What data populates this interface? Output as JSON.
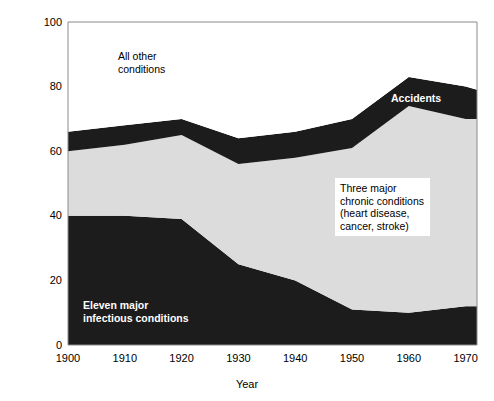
{
  "chart_data": {
    "type": "area",
    "stacked": true,
    "title": "",
    "xlabel": "Year",
    "ylabel": "Percentage of total mortality",
    "xlim": [
      1900,
      1972
    ],
    "ylim": [
      0,
      100
    ],
    "xticks": [
      1900,
      1910,
      1920,
      1930,
      1940,
      1950,
      1960,
      1970
    ],
    "xtick_labels": [
      "1900",
      "1910",
      "1920",
      "1930",
      "1940",
      "1950",
      "1960",
      "1970"
    ],
    "yticks": [
      0,
      20,
      40,
      60,
      80,
      100
    ],
    "ytick_labels": [
      "0",
      "20",
      "40",
      "60",
      "80",
      "100"
    ],
    "grid": false,
    "legend_position": "inline-annotations",
    "x": [
      1900,
      1910,
      1920,
      1930,
      1940,
      1950,
      1960,
      1970,
      1972
    ],
    "series": [
      {
        "name": "Eleven major infectious conditions",
        "color": "#1c1c1c",
        "values": [
          40,
          40,
          39,
          25,
          20,
          11,
          10,
          12,
          12
        ]
      },
      {
        "name": "Three major chronic conditions (heart disease, cancer, stroke)",
        "color": "#dcdcdc",
        "values": [
          20,
          22,
          26,
          31,
          38,
          50,
          64,
          58,
          58
        ]
      },
      {
        "name": "Accidents",
        "color": "#1c1c1c",
        "values": [
          6,
          6,
          5,
          8,
          8,
          9,
          9,
          10,
          9
        ]
      },
      {
        "name": "All other conditions",
        "color": "#ffffff",
        "values": [
          34,
          32,
          30,
          36,
          34,
          30,
          17,
          20,
          21
        ]
      }
    ],
    "cumulative_top_of_infectious": [
      40,
      40,
      39,
      25,
      20,
      11,
      10,
      12,
      12
    ],
    "cumulative_top_of_chronic": [
      60,
      62,
      65,
      56,
      58,
      61,
      74,
      70,
      70
    ],
    "cumulative_top_of_accidents": [
      66,
      68,
      70,
      64,
      66,
      70,
      83,
      80,
      79
    ],
    "annotations": [
      {
        "id": "all-other-conditions",
        "text": "All other\nconditions",
        "style": "dark-on-light",
        "x_px": 118,
        "y_px": 50
      },
      {
        "id": "accidents",
        "text": "Accidents",
        "style": "light-on-dark",
        "x_px": 391,
        "y_px": 92
      },
      {
        "id": "three-major-chronic",
        "text": "Three major\nchronic conditions\n(heart disease,\ncancer, stroke)",
        "style": "boxed",
        "x_px": 335,
        "y_px": 178
      },
      {
        "id": "eleven-major-infectious",
        "text": "Eleven major\ninfectious conditions",
        "style": "light-on-dark",
        "x_px": 83,
        "y_px": 299
      }
    ]
  },
  "axes": {
    "x_axis_title": "Year",
    "y_axis_title": "Percentage of total mortality"
  },
  "colors": {
    "dark_band": "#1c1c1c",
    "light_band": "#dcdcdc",
    "background": "#ffffff",
    "axis_line": "#8a8a8a",
    "text": "#000000"
  }
}
